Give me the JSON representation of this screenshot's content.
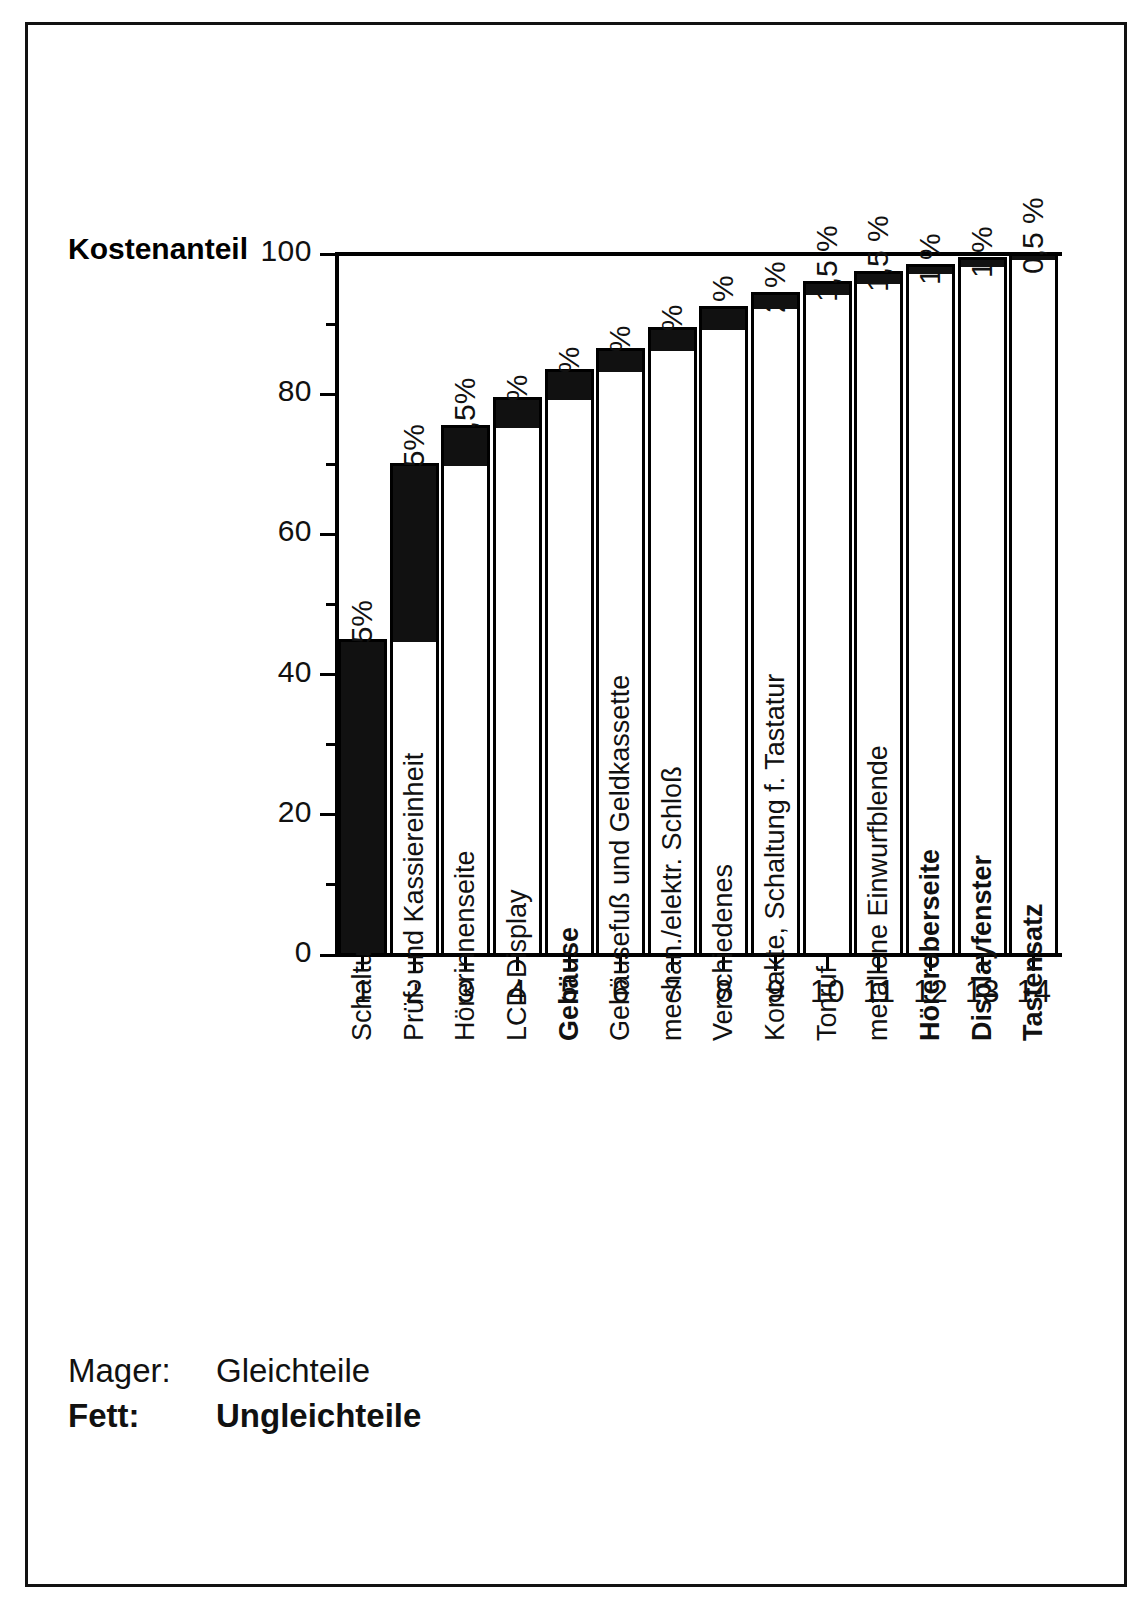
{
  "figure": {
    "y_axis_title": "Kostenanteil",
    "legend": {
      "rows": [
        {
          "key": "Mager:",
          "value": "Gleichteile",
          "weight": "regular"
        },
        {
          "key": "Fett:",
          "value": "Ungleichteile",
          "weight": "bold"
        }
      ]
    }
  },
  "chart_data": {
    "type": "bar",
    "title": "",
    "subtitle": "",
    "xlabel": "",
    "ylabel": "Kostenanteil",
    "ylim": [
      0,
      100
    ],
    "xlim": [
      0,
      14
    ],
    "grid": false,
    "legend_position": "bottom-left",
    "note": "Kumulierte Pareto-Darstellung: weisser Sockel = kumulierter Vorgaenger-Wert, schwarze Kappe = Einzelanteil des Bauteils",
    "y_ticks_major": [
      0,
      20,
      40,
      60,
      80,
      100
    ],
    "y_ticks_minor": [
      10,
      30,
      50,
      70,
      90
    ],
    "x_tick_labels": [
      "1",
      "2",
      "3",
      "4",
      "5",
      "6",
      "7",
      "8",
      "9",
      "10",
      "11",
      "12",
      "13",
      "14"
    ],
    "categories": [
      "Schaltungsplatine",
      "Prüf- und Kassiereinheit",
      "Hörerinnenseite",
      "LCD-Display",
      "Gehäuse",
      "Gehäusefuß und Geldkassette",
      "mechan./elektr. Schloß",
      "Verschiedenes",
      "Kontakte, Schaltung f. Tastatur",
      "Tonruf",
      "metallene Einwurfblende",
      "Höreroberseite",
      "Displayfenster",
      "Tastensatz"
    ],
    "category_weights": [
      "regular",
      "regular",
      "regular",
      "regular",
      "bold",
      "regular",
      "regular",
      "regular",
      "regular",
      "regular",
      "regular",
      "bold",
      "bold",
      "bold"
    ],
    "values": [
      45,
      25,
      5.5,
      4,
      4,
      3,
      3,
      3,
      2,
      1.5,
      1.5,
      1,
      1,
      0.5
    ],
    "cumulative": [
      45,
      70,
      75.5,
      79.5,
      83.5,
      86.5,
      89.5,
      92.5,
      94.5,
      96,
      97.5,
      98.5,
      99.5,
      100
    ],
    "value_labels": [
      "45%",
      "25%",
      "5,5%",
      "4%",
      "4%",
      "3%",
      "3%",
      "3 %",
      "2 %",
      "1,5 %",
      "1,5 %",
      "1 %",
      "1 %",
      "0,5 %"
    ],
    "series": [
      {
        "name": "Gleichteile / Ungleichteile (Einzelanteil)",
        "values": [
          45,
          25,
          5.5,
          4,
          4,
          3,
          3,
          3,
          2,
          1.5,
          1.5,
          1,
          1,
          0.5
        ]
      }
    ],
    "colors": {
      "increment": "#111111",
      "base": "#ffffff",
      "outline": "#000000"
    }
  }
}
